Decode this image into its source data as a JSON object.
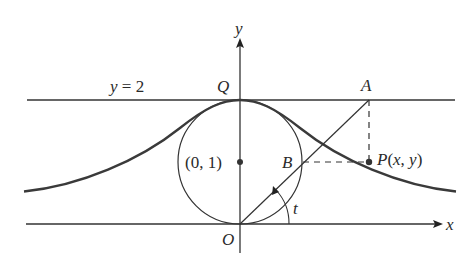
{
  "diagram": {
    "type": "witch-of-agnesi-construction",
    "colors": {
      "stroke": "#333333",
      "curve": "#3a3a3a",
      "background": "#ffffff"
    },
    "labels": {
      "y_axis": "y",
      "x_axis": "x",
      "line": "y = 2",
      "Q": "Q",
      "A": "A",
      "B": "B",
      "O": "O",
      "P": "P(x, y)",
      "center": "(0, 1)",
      "angle": "t"
    }
  }
}
